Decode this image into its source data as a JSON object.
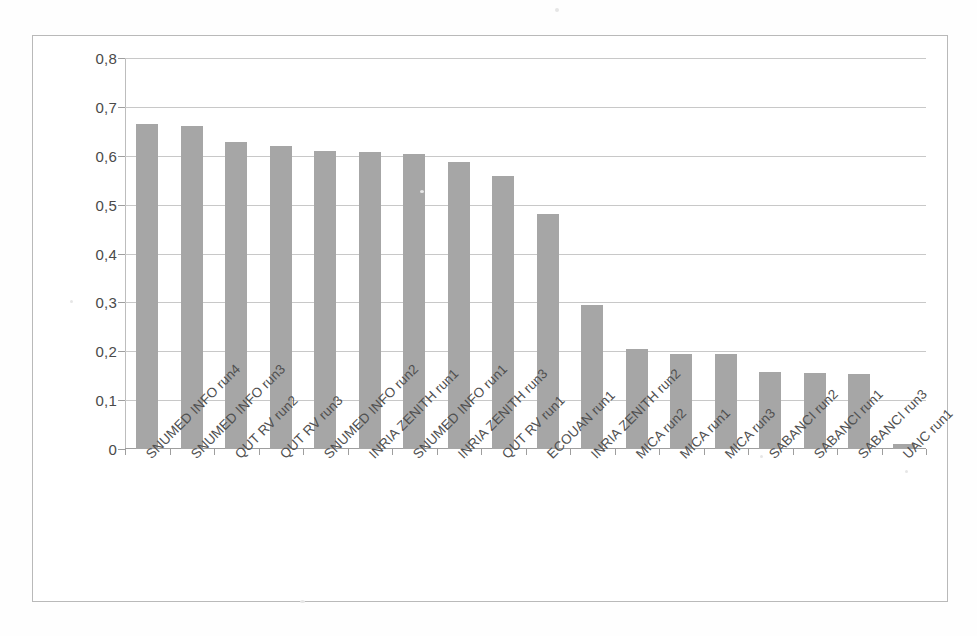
{
  "chart_data": {
    "type": "bar",
    "title": "",
    "subtitle": "",
    "xlabel": "",
    "ylabel": "",
    "ylim": [
      0,
      0.8
    ],
    "ytick_labels": [
      "0,8",
      "0,7",
      "0,6",
      "0,5",
      "0,4",
      "0,3",
      "0,2",
      "0,1",
      "0"
    ],
    "ytick_values": [
      0.8,
      0.7,
      0.6,
      0.5,
      0.4,
      0.3,
      0.2,
      0.1,
      0
    ],
    "grid": true,
    "legend": "none",
    "decimal_separator": ",",
    "bar_color": "#a6a6a6",
    "categories": [
      "SNUMED INFO run4",
      "SNUMED INFO run3",
      "QUT RV run2",
      "QUT RV run3",
      "SNUMED INFO run2",
      "INRIA ZENITH run1",
      "SNUMED INFO run1",
      "INRIA ZENITH run3",
      "QUT RV run1",
      "ECOUAN run1",
      "INRIA ZENITH run2",
      "MICA run2",
      "MICA run1",
      "MICA run3",
      "SABANCI run2",
      "SABANCI run1",
      "SABANCI run3",
      "UAIC run1"
    ],
    "values": [
      0.666,
      0.66,
      0.629,
      0.621,
      0.609,
      0.608,
      0.603,
      0.587,
      0.558,
      0.481,
      0.295,
      0.204,
      0.195,
      0.195,
      0.157,
      0.155,
      0.153,
      0.01
    ]
  }
}
